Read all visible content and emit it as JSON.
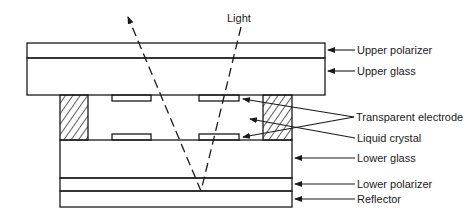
{
  "diagram": {
    "type": "cross-section",
    "light_label": "Light",
    "layers": [
      {
        "id": "upper-polarizer",
        "label": "Upper polarizer"
      },
      {
        "id": "upper-glass",
        "label": "Upper glass"
      },
      {
        "id": "transparent-electrode",
        "label": "Transparent electrode"
      },
      {
        "id": "liquid-crystal",
        "label": "Liquid crystal"
      },
      {
        "id": "lower-glass",
        "label": "Lower glass"
      },
      {
        "id": "lower-polarizer",
        "label": "Lower polarizer"
      },
      {
        "id": "reflector",
        "label": "Reflector"
      }
    ],
    "colors": {
      "line": "#1a1a1a",
      "background": "#ffffff"
    }
  }
}
